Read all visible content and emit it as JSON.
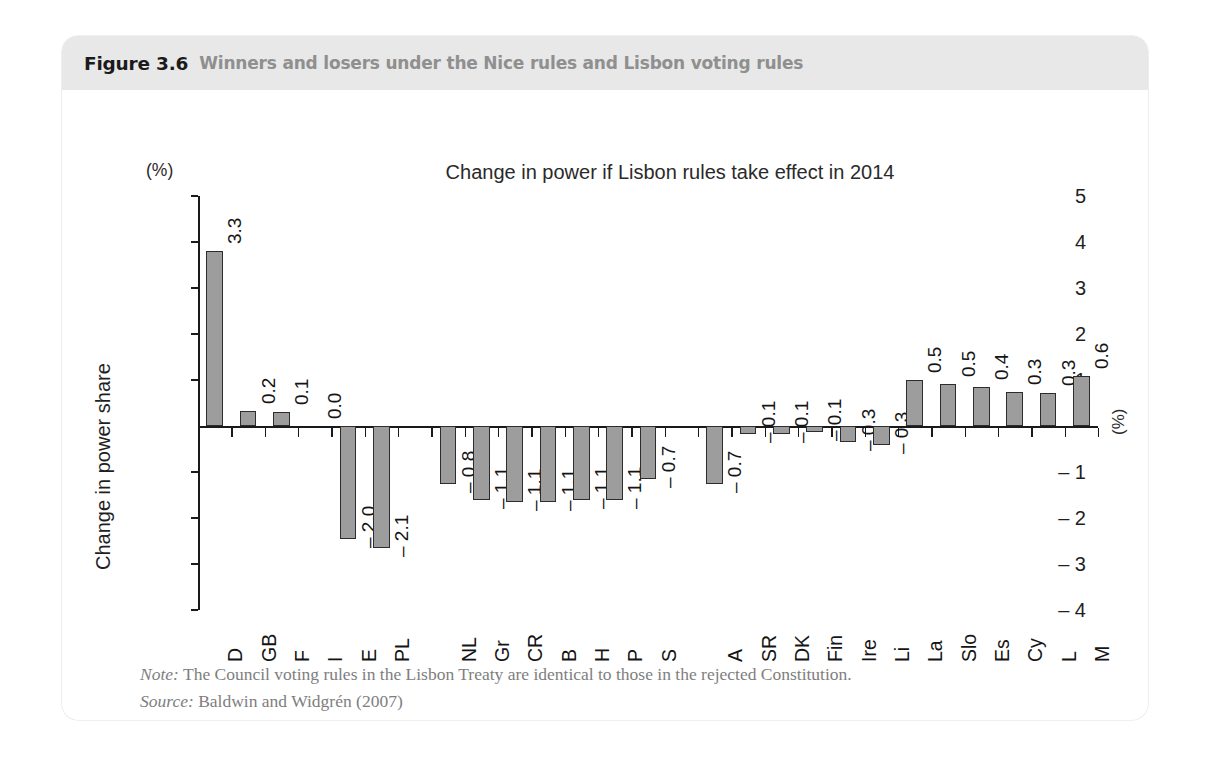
{
  "figure": {
    "label": "Figure 3.6",
    "caption": "Winners and losers under the Nice rules and Lisbon voting rules"
  },
  "chart_data": {
    "type": "bar",
    "title": "Change in power if Lisbon rules take effect in 2014",
    "xlabel": "",
    "ylabel": "Change in power share",
    "unit_top_left": "(%)",
    "unit_right": "(%)",
    "ylim": [
      -4,
      5
    ],
    "ytick_labels": [
      "5",
      "4",
      "3",
      "2",
      "1",
      "– 1",
      "– 2",
      "– 3",
      "– 4"
    ],
    "yticks": [
      5,
      4,
      3,
      2,
      1,
      -1,
      -2,
      -3,
      -4
    ],
    "grid": false,
    "legend": "none",
    "categories": [
      "D",
      "GB",
      "F",
      "I",
      "E",
      "PL",
      "NL",
      "Gr",
      "CR",
      "B",
      "H",
      "P",
      "S",
      "A",
      "SR",
      "DK",
      "Fin",
      "Ire",
      "Li",
      "La",
      "Slo",
      "Es",
      "Cy",
      "L",
      "M"
    ],
    "values": [
      3.8,
      0.33,
      0.3,
      0.0,
      -2.45,
      -2.65,
      -1.25,
      -1.6,
      -1.65,
      -1.65,
      -1.6,
      -1.6,
      -1.15,
      -1.25,
      -0.18,
      -0.18,
      -0.12,
      -0.35,
      -0.42,
      1.0,
      0.92,
      0.85,
      0.75,
      0.72,
      1.08
    ],
    "data_labels": [
      "3.3",
      "0.2",
      "0.1",
      "0.0",
      "– 2.0",
      "– 2.1",
      "– 0.8",
      "– 1.1",
      "– 1.1",
      "– 1.1",
      "– 1.1",
      "– 1.1",
      "– 0.7",
      "– 0.7",
      "– 0.1",
      "– 0.1",
      "– 0.1",
      "– 0.3",
      "– 0.3",
      "0.5",
      "0.5",
      "0.4",
      "0.3",
      "0.3",
      "0.6"
    ],
    "slot_index": [
      0,
      1,
      2,
      3,
      4,
      5,
      7,
      8,
      9,
      10,
      11,
      12,
      13,
      15,
      16,
      17,
      18,
      19,
      20,
      21,
      22,
      23,
      24,
      25,
      26
    ],
    "total_slots": 27,
    "bar_color": "#9d9d9d",
    "bar_border": "#2c2c2c"
  },
  "notes": {
    "note_prefix": "Note:",
    "note_text": " The Council voting rules in the Lisbon Treaty are identical to those in the rejected Constitution.",
    "source_prefix": "Source:",
    "source_text": " Baldwin and Widgrén (2007)"
  }
}
